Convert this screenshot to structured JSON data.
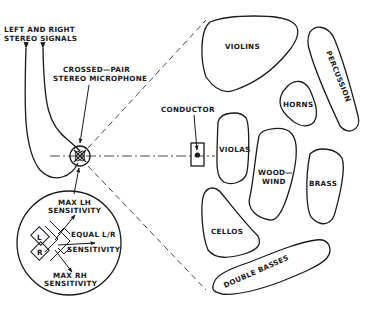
{
  "labels": {
    "signals_line1": "LEFT AND RIGHT",
    "signals_line2": "STEREO SIGNALS",
    "mic_line1": "CROSSED—PAIR",
    "mic_line2": "STEREO MICROPHONE",
    "conductor": "CONDUCTOR"
  },
  "sections": {
    "violins": "VIOLINS",
    "percussion": "PERCUSSION",
    "horns": "HORNS",
    "violas": "VIOLAS",
    "woodwind_line1": "WOOD—",
    "woodwind_line2": "WIND",
    "brass": "BRASS",
    "cellos": "CELLOS",
    "double_basses": "DOUBLE BASSES"
  },
  "inset": {
    "max_lh_line1": "MAX LH",
    "max_lh_line2": "SENSITIVITY",
    "equal_line1": "EQUAL L/R",
    "equal_line2": "SENSITIVITY",
    "max_rh_line1": "MAX RH",
    "max_rh_line2": "SENSITIVITY",
    "capsule_left": "L",
    "capsule_right": "R"
  },
  "colors": {
    "ink": "#1a1a1a",
    "background": "#ffffff"
  }
}
